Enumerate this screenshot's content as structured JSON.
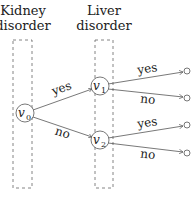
{
  "columns": [
    {
      "line1": "Kidney",
      "line2": "disorder"
    },
    {
      "line1": "Liver",
      "line2": "disorder"
    }
  ],
  "nodes": {
    "v0": "v",
    "v0_sub": "0",
    "v1": "v",
    "v1_sub": "1",
    "v2": "v",
    "v2_sub": "2"
  },
  "edges": {
    "v0_v1": "yes",
    "v0_v2": "no",
    "v1_t1": "yes",
    "v1_t2": "no",
    "v2_t3": "yes",
    "v2_t4": "no"
  },
  "colors": {
    "line": "#555555",
    "dash": "#666666"
  }
}
